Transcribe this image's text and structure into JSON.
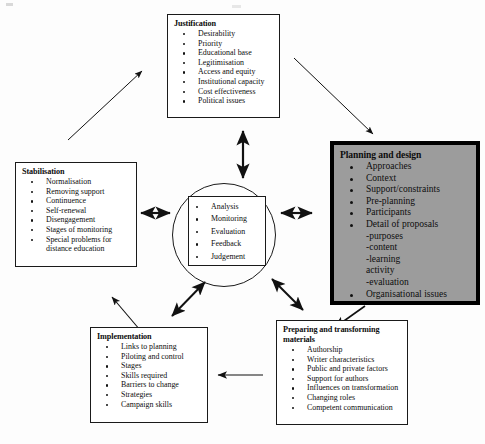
{
  "diagram": {
    "background": "#fdfdfd",
    "highlight_fill": "#9c9c9c",
    "line_color": "#1a1a1a"
  },
  "boxes": {
    "justification": {
      "title": "Justification",
      "items": [
        "Desirability",
        "Priority",
        "Educational base",
        "Legitimisation",
        "Access and equity",
        "Institutional capacity",
        "Cost effectiveness",
        "Political issues"
      ]
    },
    "planning_and_design": {
      "title": "Planning and design",
      "highlighted": true,
      "items": [
        "Approaches",
        "Context",
        "Support/constraints",
        "Pre-planning",
        "Participants",
        "Detail of proposals"
      ],
      "subitems": [
        "-purposes",
        "-content",
        "-learning",
        " activity",
        "-evaluation"
      ],
      "trailing_items": [
        "Organisational issues"
      ]
    },
    "stabilisation": {
      "title": "Stabilisation",
      "items": [
        "Normalisation",
        "Removing support",
        "Continuence",
        "Self-renewal",
        "Disengagement",
        "Stages of monitoring",
        "Special problems for"
      ],
      "continuation": "distance education"
    },
    "core": {
      "items": [
        "Analysis",
        "Monitoring",
        "Evaluation",
        "Feedback",
        "Judgement"
      ]
    },
    "implementation": {
      "title": "Implementation",
      "items": [
        "Links to planning",
        "Piloting and control",
        "Stages",
        "Skills required",
        "Barriers to change",
        "Strategies",
        "Campaign skills"
      ]
    },
    "preparing_materials": {
      "title_line1": "Preparing and transforming",
      "title_line2": "materials",
      "items": [
        "Authorship",
        "Writer characteristics",
        "Public and private factors",
        "Support for authors",
        "Influences on transformation",
        "Changing roles",
        "Competent communication"
      ]
    }
  },
  "connectors": [
    {
      "name": "stabilisation-to-justification",
      "style": "single-arrow",
      "from": "stabilisation",
      "to": "justification"
    },
    {
      "name": "justification-to-planning",
      "style": "single-arrow",
      "from": "justification",
      "to": "planning-and-design"
    },
    {
      "name": "justification-core",
      "style": "double-arrow",
      "from": "justification",
      "to": "core"
    },
    {
      "name": "stabilisation-core",
      "style": "double-arrow",
      "from": "stabilisation",
      "to": "core"
    },
    {
      "name": "planning-core",
      "style": "double-arrow",
      "from": "planning-and-design",
      "to": "core"
    },
    {
      "name": "implementation-core",
      "style": "double-arrow",
      "from": "implementation",
      "to": "core"
    },
    {
      "name": "preparing-core",
      "style": "double-arrow",
      "from": "preparing-materials",
      "to": "core"
    },
    {
      "name": "planning-to-preparing",
      "style": "single-arrow",
      "from": "planning-and-design",
      "to": "preparing-materials"
    },
    {
      "name": "preparing-to-implementation",
      "style": "single-arrow",
      "from": "preparing-materials",
      "to": "implementation"
    },
    {
      "name": "implementation-to-stabilisation",
      "style": "single-arrow",
      "from": "implementation",
      "to": "stabilisation"
    }
  ]
}
